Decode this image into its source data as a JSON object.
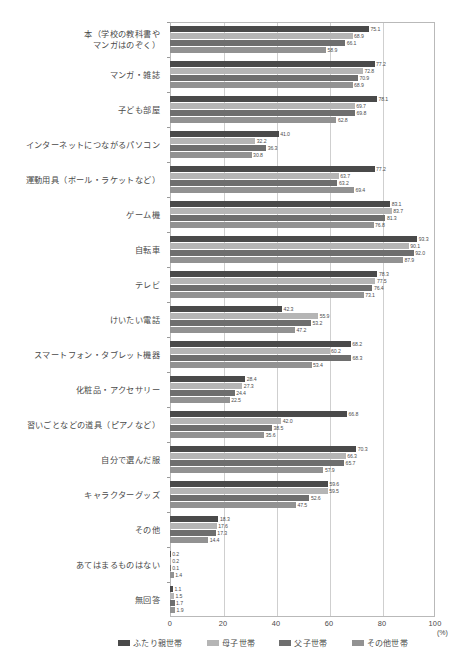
{
  "chart_data": {
    "type": "bar",
    "orientation": "horizontal",
    "title": "",
    "xlabel": "(%)",
    "ylabel": "",
    "xlim": [
      0,
      100
    ],
    "xticks": [
      "0",
      "20",
      "40",
      "60",
      "80",
      "100"
    ],
    "grid": true,
    "legend_position": "bottom",
    "unit": "(%)",
    "categories": [
      "本（学校の教科書や\nマンガはのぞく）",
      "マンガ・雑誌",
      "子ども部屋",
      "インターネットにつながるパソコン",
      "運動用具（ボール・ラケットなど）",
      "ゲーム機",
      "自転車",
      "テレビ",
      "けいたい電話",
      "スマートフォン・タブレット機器",
      "化粧品・アクセサリー",
      "習いごとなどの道具（ピアノなど）",
      "自分で選んだ服",
      "キャラクターグッズ",
      "その他",
      "あてはまるものはない",
      "無回答"
    ],
    "series": [
      {
        "name": "ふたり親世帯",
        "color": "#4a4a4a",
        "values": [
          75.1,
          77.2,
          78.1,
          41.0,
          77.2,
          83.1,
          93.3,
          78.3,
          42.3,
          68.2,
          28.4,
          66.8,
          70.3,
          59.6,
          18.3,
          0.2,
          1.1
        ]
      },
      {
        "name": "母子世帯",
        "color": "#b5b5b5",
        "values": [
          68.9,
          72.8,
          69.7,
          32.2,
          63.7,
          83.7,
          90.1,
          77.5,
          55.9,
          60.2,
          27.3,
          42.0,
          66.3,
          59.5,
          17.6,
          0.2,
          1.5
        ]
      },
      {
        "name": "父子世帯",
        "color": "#6e6e6e",
        "values": [
          66.1,
          70.9,
          69.8,
          36.3,
          63.2,
          81.3,
          92.0,
          76.4,
          53.2,
          68.3,
          24.4,
          38.5,
          65.7,
          52.6,
          17.3,
          0.1,
          1.7
        ]
      },
      {
        "name": "その他世帯",
        "color": "#929292",
        "values": [
          58.9,
          68.9,
          62.8,
          30.8,
          69.4,
          76.8,
          87.9,
          73.1,
          47.2,
          53.4,
          22.5,
          35.6,
          57.9,
          47.5,
          14.4,
          1.4,
          1.9
        ]
      }
    ]
  },
  "legend": {
    "items": [
      {
        "label": "ふたり親世帯",
        "color": "#4a4a4a"
      },
      {
        "label": "母子世帯",
        "color": "#b5b5b5"
      },
      {
        "label": "父子世帯",
        "color": "#6e6e6e"
      },
      {
        "label": "その他世帯",
        "color": "#929292"
      }
    ]
  },
  "axis": {
    "unit_label": "(%)",
    "ticks": [
      "0",
      "20",
      "40",
      "60",
      "80",
      "100"
    ]
  }
}
